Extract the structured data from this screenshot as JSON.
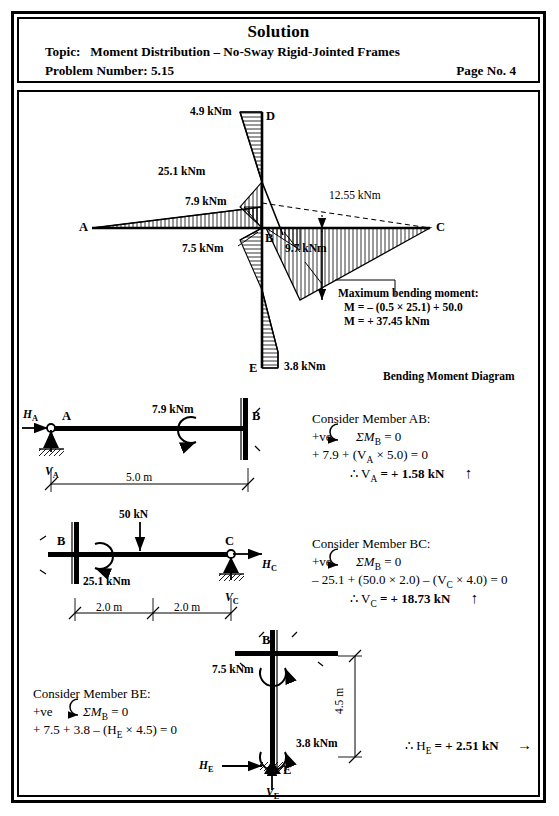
{
  "header": {
    "title": "Solution",
    "topic_label": "Topic:",
    "topic": "Moment Distribution – No-Sway Rigid-Jointed Frames",
    "problem_label": "Problem Number:",
    "problem_number": "5.15",
    "page_label": "Page No. 4"
  },
  "bmd": {
    "caption": "Bending Moment Diagram",
    "labels": {
      "d_moment": "4.9 kNm",
      "b_col_moment": "25.1 kNm",
      "ab_moment": "7.9 kNm",
      "be_moment": "7.5 kNm",
      "bc_moment": "9.7 kNm",
      "mid_moment": "12.55 kNm",
      "e_moment": "3.8 kNm"
    },
    "points": {
      "A": "A",
      "B": "B",
      "C": "C",
      "D": "D",
      "E": "E"
    },
    "max_moment": {
      "heading": "Maximum bending moment:",
      "line1": "M = – (0.5 × 25.1) + 50.0",
      "line2": "M = + 37.45 kNm"
    }
  },
  "fbd_ab": {
    "point_a": "A",
    "point_b": "B",
    "h_a": "H",
    "h_a_sub": "A",
    "v_a": "V",
    "v_a_sub": "A",
    "moment": "7.9 kNm",
    "span": "5.0 m"
  },
  "fbd_bc": {
    "point_b": "B",
    "point_c": "C",
    "load": "50 kN",
    "moment": "25.1 kNm",
    "h_c": "H",
    "h_c_sub": "C",
    "v_c": "V",
    "v_c_sub": "C",
    "dim_left": "2.0 m",
    "dim_right": "2.0 m"
  },
  "fbd_be": {
    "point_b": "B",
    "point_e": "E",
    "moment_b": "7.5 kNm",
    "moment_e": "3.8 kNm",
    "height": "4.5 m",
    "h_e": "H",
    "h_e_sub": "E",
    "v_e": "V",
    "v_e_sub": "E"
  },
  "calc_ab": {
    "heading": "Consider Member AB:",
    "sign": "+ve",
    "sum": "ΣM",
    "sum_sub": "B",
    "sum_eq": " = 0",
    "equation": "+ 7.9 + (V",
    "equation_sub": "A",
    "equation_rest": " × 5.0) = 0",
    "result_prefix": "∴ V",
    "result_sub": "A",
    "result": " = + 1.58 kN",
    "arrow": "↑"
  },
  "calc_bc": {
    "heading": "Consider Member BC:",
    "sign": "+ve",
    "sum": "ΣM",
    "sum_sub": "B",
    "sum_eq": " = 0",
    "equation": "– 25.1 + (50.0 × 2.0) – (V",
    "equation_sub": "C",
    "equation_rest": " × 4.0) = 0",
    "result_prefix": "∴ V",
    "result_sub": "C",
    "result": " = + 18.73 kN",
    "arrow": "↑"
  },
  "calc_be": {
    "heading": "Consider Member BE:",
    "sign": "+ve",
    "sum": "ΣM",
    "sum_sub": "B",
    "sum_eq": " = 0",
    "equation": "+ 7.5 + 3.8 – (H",
    "equation_sub": "E",
    "equation_rest": " × 4.5) = 0",
    "result_prefix": "∴ H",
    "result_sub": "E",
    "result": " = + 2.51 kN",
    "arrow": "→"
  },
  "colors": {
    "ink": "#000000",
    "paper": "#ffffff"
  }
}
